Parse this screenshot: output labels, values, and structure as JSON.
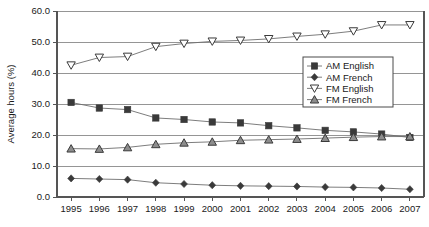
{
  "chart_data": {
    "type": "line",
    "title": "",
    "xlabel": "",
    "ylabel": "Average hours (%)",
    "x": [
      1995,
      1996,
      1997,
      1998,
      1999,
      2000,
      2001,
      2002,
      2003,
      2004,
      2005,
      2006,
      2007
    ],
    "categories": [
      "1995",
      "1996",
      "1997",
      "1998",
      "1999",
      "2000",
      "2001",
      "2002",
      "2003",
      "2004",
      "2005",
      "2006",
      "2007"
    ],
    "ylim": [
      0.0,
      60.0
    ],
    "yticks": [
      0.0,
      10.0,
      20.0,
      30.0,
      40.0,
      50.0,
      60.0
    ],
    "ytick_labels": [
      "0.0",
      "10.0",
      "20.0",
      "30.0",
      "40.0",
      "50.0",
      "60.0"
    ],
    "grid": true,
    "legend_position": "center-right",
    "series": [
      {
        "name": "AM English",
        "marker": "filled-square",
        "values": [
          30.5,
          28.7,
          28.2,
          25.5,
          25.0,
          24.2,
          23.9,
          23.0,
          22.3,
          21.5,
          21.0,
          20.3,
          19.2
        ]
      },
      {
        "name": "AM French",
        "marker": "filled-diamond",
        "values": [
          6.0,
          5.8,
          5.6,
          4.6,
          4.2,
          3.8,
          3.6,
          3.5,
          3.4,
          3.2,
          3.1,
          2.9,
          2.5
        ]
      },
      {
        "name": "FM English",
        "marker": "open-triangle-down",
        "values": [
          42.5,
          45.0,
          45.3,
          48.5,
          49.5,
          50.2,
          50.5,
          51.0,
          51.8,
          52.5,
          53.5,
          55.5,
          55.5
        ]
      },
      {
        "name": "FM French",
        "marker": "filled-triangle-up",
        "values": [
          15.6,
          15.5,
          16.0,
          17.0,
          17.5,
          17.8,
          18.3,
          18.5,
          18.7,
          19.0,
          19.3,
          19.5,
          19.5
        ]
      }
    ],
    "colors": {
      "marker_fill": "#3a3a3a",
      "marker_open_fill": "#ffffff",
      "line": "#6e6e6e",
      "grid": "#8a8a8a",
      "axis": "#555555",
      "text": "#1a1a1a"
    }
  },
  "legend": {
    "items": [
      {
        "label": "AM English"
      },
      {
        "label": "AM French"
      },
      {
        "label": "FM English"
      },
      {
        "label": "FM French"
      }
    ]
  }
}
